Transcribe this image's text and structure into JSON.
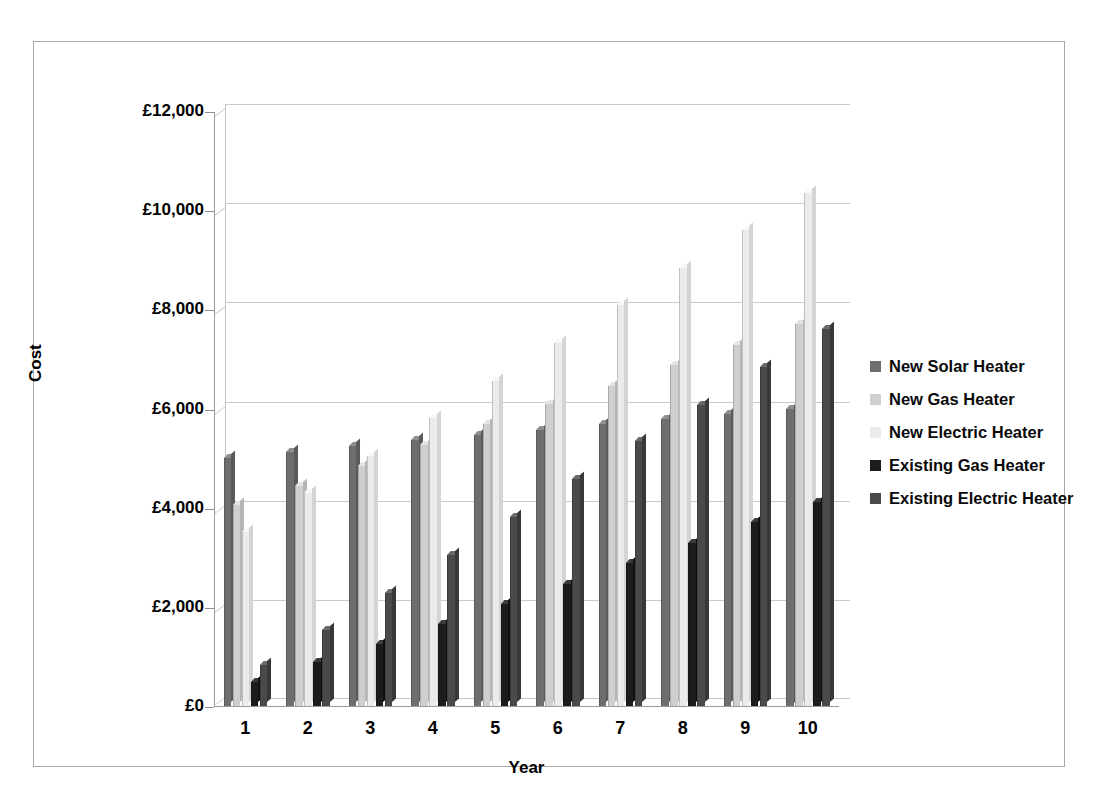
{
  "chart_data": {
    "type": "bar",
    "title": "",
    "xlabel": "Year",
    "ylabel": "Cost",
    "categories": [
      "1",
      "2",
      "3",
      "4",
      "5",
      "6",
      "7",
      "8",
      "9",
      "10"
    ],
    "ylim": [
      0,
      12000
    ],
    "ytick_values": [
      0,
      2000,
      4000,
      6000,
      8000,
      10000,
      12000
    ],
    "ytick_labels": [
      "£0",
      "£2,000",
      "£4,000",
      "£6,000",
      "£8,000",
      "£10,000",
      "£12,000"
    ],
    "grid": true,
    "legend_position": "right",
    "series": [
      {
        "name": "New Solar Heater",
        "color": "#6e6e6e",
        "top_color": "#8f8f8f",
        "side_color": "#5a5a5a",
        "values": [
          5010,
          5130,
          5250,
          5360,
          5460,
          5570,
          5680,
          5790,
          5890,
          6000
        ]
      },
      {
        "name": "New Gas Heater",
        "color": "#cfcfcf",
        "top_color": "#e4e4e4",
        "side_color": "#b5b5b5",
        "values": [
          4060,
          4440,
          4840,
          5260,
          5680,
          6090,
          6460,
          6870,
          7290,
          7710
        ]
      },
      {
        "name": "New Electric Heater",
        "color": "#ebebeb",
        "top_color": "#f7f7f7",
        "side_color": "#d4d4d4",
        "values": [
          3510,
          4300,
          5040,
          5800,
          6560,
          7320,
          8080,
          8840,
          9600,
          10350
        ]
      },
      {
        "name": "Existing Gas Heater",
        "color": "#1c1c1c",
        "top_color": "#3a3a3a",
        "side_color": "#101010",
        "values": [
          480,
          880,
          1260,
          1660,
          2060,
          2460,
          2890,
          3280,
          3710,
          4110
        ]
      },
      {
        "name": "Existing Electric Heater",
        "color": "#4a4a4a",
        "top_color": "#6a6a6a",
        "side_color": "#383838",
        "values": [
          830,
          1540,
          2270,
          3040,
          3810,
          4570,
          5340,
          6080,
          6840,
          7610
        ]
      }
    ]
  },
  "legend": {
    "items": [
      "New Solar Heater",
      "New Gas Heater",
      "New Electric Heater",
      "Existing Gas Heater",
      "Existing Electric Heater"
    ]
  }
}
